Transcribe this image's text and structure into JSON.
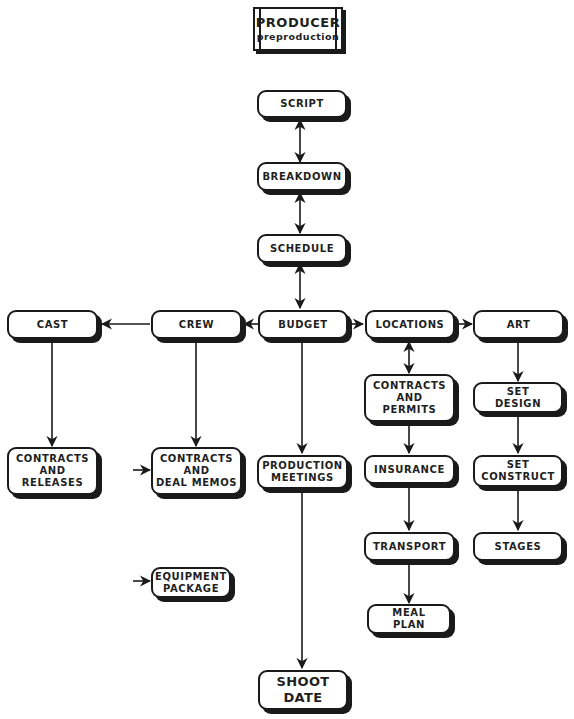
{
  "title": {
    "main": "PRODUCER",
    "sub": "preproduction"
  },
  "nodes": {
    "script": "SCRIPT",
    "breakdown": "BREAKDOWN",
    "schedule": "SCHEDULE",
    "budget": "BUDGET",
    "crew": "CREW",
    "cast": "CAST",
    "locations": "LOCATIONS",
    "art": "ART",
    "contracts_releases": "CONTRACTS\nAND\nRELEASES",
    "contracts_deal_memos": "CONTRACTS\nAND\nDEAL  MEMOS",
    "equipment_package": "EQUIPMENT\nPACKAGE",
    "production_meetings": "PRODUCTION\nMEETINGS",
    "shoot_date": "SHOOT\nDATE",
    "contracts_permits": "CONTRACTS\nAND\nPERMITS",
    "insurance": "INSURANCE",
    "transport": "TRANSPORT",
    "meal_plan": "MEAL\nPLAN",
    "set_design": "SET\nDESIGN",
    "set_construct": "SET\nCONSTRUCT",
    "stages": "STAGES"
  },
  "edges": [
    {
      "from": "script",
      "to": "breakdown",
      "type": "bidirectional"
    },
    {
      "from": "breakdown",
      "to": "schedule",
      "type": "bidirectional"
    },
    {
      "from": "schedule",
      "to": "budget",
      "type": "bidirectional"
    },
    {
      "from": "budget",
      "to": "crew",
      "type": "directed"
    },
    {
      "from": "crew",
      "to": "cast",
      "type": "directed"
    },
    {
      "from": "budget",
      "to": "locations",
      "type": "directed"
    },
    {
      "from": "locations",
      "to": "art",
      "type": "directed"
    },
    {
      "from": "cast",
      "to": "contracts_releases",
      "type": "directed"
    },
    {
      "from": "crew",
      "to": "contracts_deal_memos",
      "type": "directed"
    },
    {
      "from": "budget",
      "to": "production_meetings",
      "type": "directed"
    },
    {
      "from": "production_meetings",
      "to": "shoot_date",
      "type": "directed"
    },
    {
      "from": "locations",
      "to": "contracts_permits",
      "type": "bidirectional"
    },
    {
      "from": "contracts_permits",
      "to": "insurance",
      "type": "directed"
    },
    {
      "from": "insurance",
      "to": "transport",
      "type": "directed"
    },
    {
      "from": "transport",
      "to": "meal_plan",
      "type": "directed"
    },
    {
      "from": "art",
      "to": "set_design",
      "type": "directed"
    },
    {
      "from": "set_design",
      "to": "set_construct",
      "type": "directed"
    },
    {
      "from": "set_construct",
      "to": "stages",
      "type": "directed"
    },
    {
      "from": "external",
      "to": "contracts_deal_memos",
      "type": "directed"
    },
    {
      "from": "external",
      "to": "equipment_package",
      "type": "directed"
    }
  ],
  "colors": {
    "ink": "#1a1a1a",
    "background": "#ffffff"
  }
}
